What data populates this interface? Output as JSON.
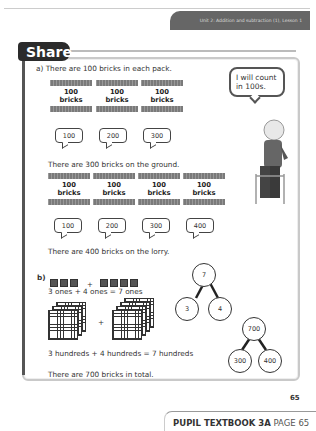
{
  "header": {
    "unit_label": "Unit 2: Addition and subtraction (1), Lesson 1"
  },
  "section": {
    "title": "Share"
  },
  "part_a": {
    "intro": "a) There are 100 bricks in each pack.",
    "speech": "I will count in 100s.",
    "row1": {
      "bricks": [
        {
          "n": "100",
          "w": "bricks"
        },
        {
          "n": "100",
          "w": "bricks"
        },
        {
          "n": "100",
          "w": "bricks"
        }
      ],
      "counts": [
        "100",
        "200",
        "300"
      ],
      "summary": "There are 300 bricks on the ground."
    },
    "row2": {
      "bricks": [
        {
          "n": "100",
          "w": "bricks"
        },
        {
          "n": "100",
          "w": "bricks"
        },
        {
          "n": "100",
          "w": "bricks"
        },
        {
          "n": "100",
          "w": "bricks"
        }
      ],
      "counts": [
        "100",
        "200",
        "300",
        "400"
      ],
      "summary": "There are 400 bricks on the lorry."
    }
  },
  "part_b": {
    "label": "b)",
    "plus": "+",
    "ones_sentence": "3 ones + 4 ones = 7 ones",
    "hundreds_sentence": "3 hundreds + 4 hundreds = 7 hundreds",
    "total": "There are 700 bricks in total.",
    "bond_ones": {
      "whole": "7",
      "parts": [
        "3",
        "4"
      ]
    },
    "bond_hundreds": {
      "whole": "700",
      "parts": [
        "300",
        "400"
      ]
    }
  },
  "page_number": "65",
  "footer": {
    "book": "PUPIL TEXTBOOK 3A",
    "page": "PAGE 65"
  }
}
